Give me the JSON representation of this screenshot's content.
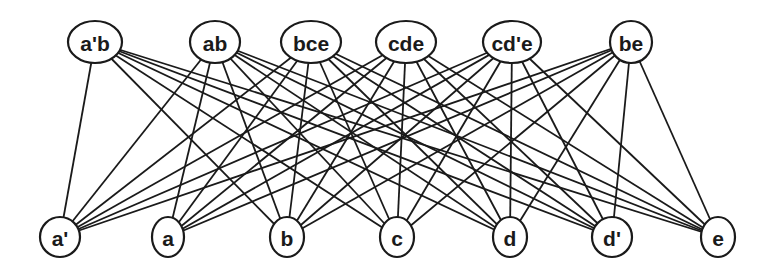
{
  "diagram": {
    "type": "bipartite-graph",
    "stroke_color": "#1a1a1a",
    "background": "#ffffff",
    "top_nodes": [
      {
        "id": "a'b",
        "label": "a'b",
        "x": 95,
        "y": 42,
        "rx": 27,
        "ry": 21
      },
      {
        "id": "ab",
        "label": "ab",
        "x": 215,
        "y": 42,
        "rx": 25,
        "ry": 21
      },
      {
        "id": "bce",
        "label": "bce",
        "x": 311,
        "y": 42,
        "rx": 30,
        "ry": 21
      },
      {
        "id": "cde",
        "label": "cde",
        "x": 406,
        "y": 42,
        "rx": 30,
        "ry": 21
      },
      {
        "id": "cd'e",
        "label": "cd'e",
        "x": 512,
        "y": 42,
        "rx": 29,
        "ry": 21
      },
      {
        "id": "be",
        "label": "be",
        "x": 631,
        "y": 42,
        "rx": 21,
        "ry": 21
      }
    ],
    "bottom_nodes": [
      {
        "id": "a'",
        "label": "a'",
        "x": 60,
        "y": 237,
        "rx": 20,
        "ry": 20
      },
      {
        "id": "a",
        "label": "a",
        "x": 168,
        "y": 237,
        "rx": 16,
        "ry": 20
      },
      {
        "id": "b",
        "label": "b",
        "x": 287,
        "y": 237,
        "rx": 17,
        "ry": 20
      },
      {
        "id": "c",
        "label": "c",
        "x": 397,
        "y": 237,
        "rx": 17,
        "ry": 20
      },
      {
        "id": "d",
        "label": "d",
        "x": 510,
        "y": 237,
        "rx": 17,
        "ry": 20
      },
      {
        "id": "d'",
        "label": "d'",
        "x": 612,
        "y": 237,
        "rx": 20,
        "ry": 20
      },
      {
        "id": "e",
        "label": "e",
        "x": 718,
        "y": 237,
        "rx": 17,
        "ry": 20
      }
    ],
    "edges": [
      [
        "a'b",
        "a'"
      ],
      [
        "a'b",
        "b"
      ],
      [
        "a'b",
        "c"
      ],
      [
        "a'b",
        "d"
      ],
      [
        "a'b",
        "d'"
      ],
      [
        "a'b",
        "e"
      ],
      [
        "ab",
        "a'"
      ],
      [
        "ab",
        "a"
      ],
      [
        "ab",
        "b"
      ],
      [
        "ab",
        "c"
      ],
      [
        "ab",
        "d"
      ],
      [
        "ab",
        "d'"
      ],
      [
        "ab",
        "e"
      ],
      [
        "bce",
        "a'"
      ],
      [
        "bce",
        "a"
      ],
      [
        "bce",
        "b"
      ],
      [
        "bce",
        "c"
      ],
      [
        "bce",
        "d"
      ],
      [
        "bce",
        "d'"
      ],
      [
        "bce",
        "e"
      ],
      [
        "cde",
        "a'"
      ],
      [
        "cde",
        "a"
      ],
      [
        "cde",
        "b"
      ],
      [
        "cde",
        "c"
      ],
      [
        "cde",
        "d"
      ],
      [
        "cde",
        "d'"
      ],
      [
        "cde",
        "e"
      ],
      [
        "cd'e",
        "a'"
      ],
      [
        "cd'e",
        "a"
      ],
      [
        "cd'e",
        "b"
      ],
      [
        "cd'e",
        "c"
      ],
      [
        "cd'e",
        "d"
      ],
      [
        "cd'e",
        "d'"
      ],
      [
        "cd'e",
        "e"
      ],
      [
        "be",
        "a'"
      ],
      [
        "be",
        "a"
      ],
      [
        "be",
        "b"
      ],
      [
        "be",
        "c"
      ],
      [
        "be",
        "d"
      ],
      [
        "be",
        "d'"
      ],
      [
        "be",
        "e"
      ]
    ]
  }
}
